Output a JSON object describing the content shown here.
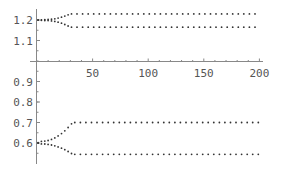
{
  "chart_data": {
    "type": "scatter",
    "title": "",
    "xlabel": "",
    "ylabel": "",
    "xlim": [
      0,
      200
    ],
    "ylim": [
      0.53,
      1.25
    ],
    "axis_origin": {
      "x": 0,
      "y": 1.0
    },
    "grid": false,
    "legend": null,
    "x_ticks": [
      50,
      100,
      150,
      200
    ],
    "x_tick_labels": [
      "50",
      "100",
      "150",
      "200"
    ],
    "y_ticks": [
      1.2,
      1.1,
      0.9,
      0.8,
      0.7,
      0.6
    ],
    "y_tick_labels": [
      "1.2",
      "1.1",
      "0.9",
      "0.8",
      "0.7",
      "0.6"
    ],
    "marker": "dot",
    "marker_color": "#333333",
    "axis_color": "#888888",
    "series": [
      {
        "name": "upper-high",
        "start": [
          0,
          1.2
        ],
        "split_x": 8,
        "settle_x": 30,
        "plateau": 1.23,
        "end_x": 200,
        "step": 5
      },
      {
        "name": "upper-low",
        "start": [
          0,
          1.2
        ],
        "split_x": 8,
        "settle_x": 30,
        "plateau": 1.165,
        "end_x": 200,
        "step": 5
      },
      {
        "name": "lower-high",
        "start": [
          0,
          0.6
        ],
        "split_x": 4,
        "settle_x": 32,
        "plateau": 0.7,
        "end_x": 200,
        "step": 5
      },
      {
        "name": "lower-low",
        "start": [
          0,
          0.6
        ],
        "split_x": 4,
        "settle_x": 32,
        "plateau": 0.545,
        "end_x": 200,
        "step": 5
      }
    ]
  }
}
